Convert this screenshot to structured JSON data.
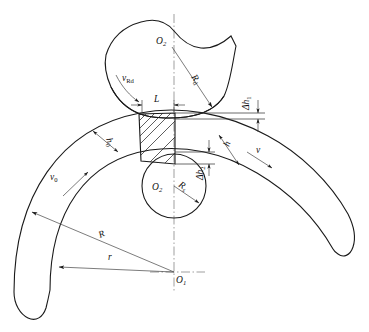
{
  "figure": {
    "type": "technical-diagram",
    "background": "#ffffff",
    "line_color": "#1a1a1a",
    "thin_line_color": "#3a3a3a",
    "centerline_color": "#777777"
  },
  "labels": {
    "roll_center": {
      "base": "O",
      "sub": "2"
    },
    "mandrel_center": {
      "base": "O",
      "sub": "2"
    },
    "ring_center": {
      "base": "O",
      "sub": "1"
    },
    "roll_radius": {
      "base": "R",
      "sub": "d"
    },
    "mandrel_radius": {
      "base": "R",
      "sub": "s"
    },
    "ring_outer_radius": {
      "base": "R",
      "sub": ""
    },
    "ring_inner_radius": {
      "base": "r",
      "sub": ""
    },
    "contact_length": {
      "base": "L",
      "sub": ""
    },
    "thickness_in": {
      "base": "h",
      "sub": "0"
    },
    "thickness_out": {
      "base": "h",
      "sub": ""
    },
    "reduction_top": {
      "base": "Δh",
      "sub": "1"
    },
    "reduction_bottom": {
      "base": "Δh",
      "sub": "2"
    },
    "velocity_roll": {
      "base": "v",
      "sub": "Rd"
    },
    "velocity_in": {
      "base": "v",
      "sub": "0"
    },
    "velocity_out": {
      "base": "v",
      "sub": ""
    }
  },
  "elements": {
    "driven_roll": "upper wavy-profiled driven roll",
    "mandrel": "small circle mandrel at ring inner surface",
    "ring_workpiece": "large arc band workpiece with wavy ends",
    "deformation_zone": "hatched quadrilateral between roll and mandrel",
    "centerline_vertical": "vertical dash-dot axis",
    "centerline_horizontal": "short dash-dot axis at O1"
  }
}
